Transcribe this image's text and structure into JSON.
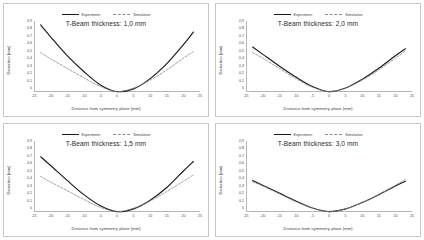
{
  "figure": {
    "panel_count": 4,
    "layout": "2x2-grid"
  },
  "legend": {
    "experiment_label": "Experiment",
    "simulation_label": "Simulation",
    "experiment_color": "#1a1a1a",
    "simulation_color": "#8c8c8c",
    "experiment_style": "solid",
    "simulation_style": "dashed",
    "position": "top-center"
  },
  "axes": {
    "xlabel": "Distance from symmetry plane [mm]",
    "ylabel": "Distortion [mm]",
    "xticks": [
      -25,
      -20,
      -15,
      -10,
      -5,
      0,
      5,
      10,
      15,
      20,
      25
    ],
    "yticks": [
      "0,9",
      "0,8",
      "0,7",
      "0,6",
      "0,5",
      "0,4",
      "0,3",
      "0,2",
      "0,1",
      "0"
    ],
    "xlim": [
      -25,
      25
    ],
    "ylim": [
      0,
      0.9
    ],
    "grid": false
  },
  "chart_data": [
    {
      "type": "line",
      "title": "T-Beam thickness: 1,0 mm",
      "xlabel": "Distance from symmetry plane [mm]",
      "ylabel": "Distortion [mm]",
      "xlim": [
        -25,
        25
      ],
      "ylim": [
        0,
        0.9
      ],
      "x": [
        -23,
        -20,
        -15,
        -10,
        -5,
        0,
        5,
        10,
        15,
        20,
        23
      ],
      "series": [
        {
          "name": "Experiment",
          "style": "solid",
          "color": "#1a1a1a",
          "values": [
            0.85,
            0.7,
            0.46,
            0.26,
            0.09,
            0.005,
            0.04,
            0.17,
            0.36,
            0.6,
            0.76
          ]
        },
        {
          "name": "Simulation",
          "style": "dashed",
          "color": "#8c8c8c",
          "values": [
            0.5,
            0.42,
            0.3,
            0.18,
            0.07,
            0.005,
            0.05,
            0.15,
            0.28,
            0.43,
            0.51
          ]
        }
      ]
    },
    {
      "type": "line",
      "title": "T-Beam thickness: 2,0 mm",
      "xlabel": "Distance from symmetry plane [mm]",
      "ylabel": "Distortion [mm]",
      "xlim": [
        -25,
        25
      ],
      "ylim": [
        0,
        0.9
      ],
      "x": [
        -23,
        -20,
        -15,
        -10,
        -5,
        0,
        5,
        10,
        15,
        20,
        23
      ],
      "series": [
        {
          "name": "Experiment",
          "style": "solid",
          "color": "#1a1a1a",
          "values": [
            0.57,
            0.48,
            0.33,
            0.19,
            0.07,
            0.005,
            0.05,
            0.16,
            0.3,
            0.46,
            0.55
          ]
        },
        {
          "name": "Simulation",
          "style": "dashed",
          "color": "#8c8c8c",
          "values": [
            0.5,
            0.43,
            0.3,
            0.17,
            0.06,
            0.005,
            0.05,
            0.15,
            0.28,
            0.43,
            0.52
          ]
        }
      ]
    },
    {
      "type": "line",
      "title": "T-Beam thickness: 1,5 mm",
      "xlabel": "Distance from symmetry plane [mm]",
      "ylabel": "Distortion [mm]",
      "xlim": [
        -25,
        25
      ],
      "ylim": [
        0,
        0.9
      ],
      "x": [
        -23,
        -20,
        -15,
        -10,
        -5,
        0,
        5,
        10,
        15,
        20,
        23
      ],
      "series": [
        {
          "name": "Experiment",
          "style": "solid",
          "color": "#1a1a1a",
          "values": [
            0.7,
            0.59,
            0.4,
            0.22,
            0.08,
            0.005,
            0.04,
            0.15,
            0.31,
            0.52,
            0.64
          ]
        },
        {
          "name": "Simulation",
          "style": "dashed",
          "color": "#8c8c8c",
          "values": [
            0.45,
            0.38,
            0.27,
            0.16,
            0.06,
            0.005,
            0.05,
            0.14,
            0.26,
            0.39,
            0.47
          ]
        }
      ]
    },
    {
      "type": "line",
      "title": "T-Beam thickness: 3,0 mm",
      "xlabel": "Distance from symmetry plane [mm]",
      "ylabel": "Distortion [mm]",
      "xlim": [
        -25,
        25
      ],
      "ylim": [
        0,
        0.9
      ],
      "x": [
        -23,
        -20,
        -15,
        -10,
        -5,
        0,
        5,
        10,
        15,
        20,
        23
      ],
      "series": [
        {
          "name": "Experiment",
          "style": "solid",
          "color": "#1a1a1a",
          "values": [
            0.4,
            0.34,
            0.24,
            0.14,
            0.05,
            0.005,
            0.04,
            0.12,
            0.22,
            0.33,
            0.39
          ]
        },
        {
          "name": "Simulation",
          "style": "dashed",
          "color": "#8c8c8c",
          "values": [
            0.38,
            0.33,
            0.23,
            0.13,
            0.05,
            0.005,
            0.04,
            0.12,
            0.22,
            0.34,
            0.41
          ]
        }
      ]
    }
  ]
}
